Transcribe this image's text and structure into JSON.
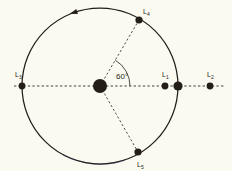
{
  "diagram": {
    "background_color": "#fbfaf0",
    "stroke_color": "#231f18",
    "highlight_arc_color": "#8d8ec6",
    "angle_label": "60°",
    "orbit": {
      "center_x": 100,
      "center_y": 86,
      "radius": 78,
      "direction_arrow": "counterclockwise-arrowhead"
    },
    "bodies": [
      {
        "id": "sun",
        "name": "central-body",
        "x": 100,
        "y": 86,
        "r": 7.0,
        "label": ""
      },
      {
        "id": "earth",
        "name": "orbiting-body",
        "x": 178,
        "y": 86,
        "r": 4.6,
        "label": ""
      }
    ],
    "points": [
      {
        "id": "L1",
        "label": "L",
        "sub": "1",
        "x": 165,
        "y": 86,
        "r": 3.4,
        "label_x": 162,
        "label_y": 77
      },
      {
        "id": "L2",
        "label": "L",
        "sub": "2",
        "x": 210,
        "y": 86,
        "r": 3.4,
        "label_x": 207,
        "label_y": 77
      },
      {
        "id": "L3",
        "label": "L",
        "sub": "3",
        "x": 22,
        "y": 86,
        "r": 3.4,
        "label_x": 15,
        "label_y": 77
      },
      {
        "id": "L4",
        "label": "L",
        "sub": "4",
        "x": 139,
        "y": 20,
        "r": 3.6,
        "label_x": 143,
        "label_y": 14
      },
      {
        "id": "L5",
        "label": "L",
        "sub": "5",
        "x": 138,
        "y": 152,
        "r": 3.6,
        "label_x": 137,
        "label_y": 167
      }
    ]
  }
}
